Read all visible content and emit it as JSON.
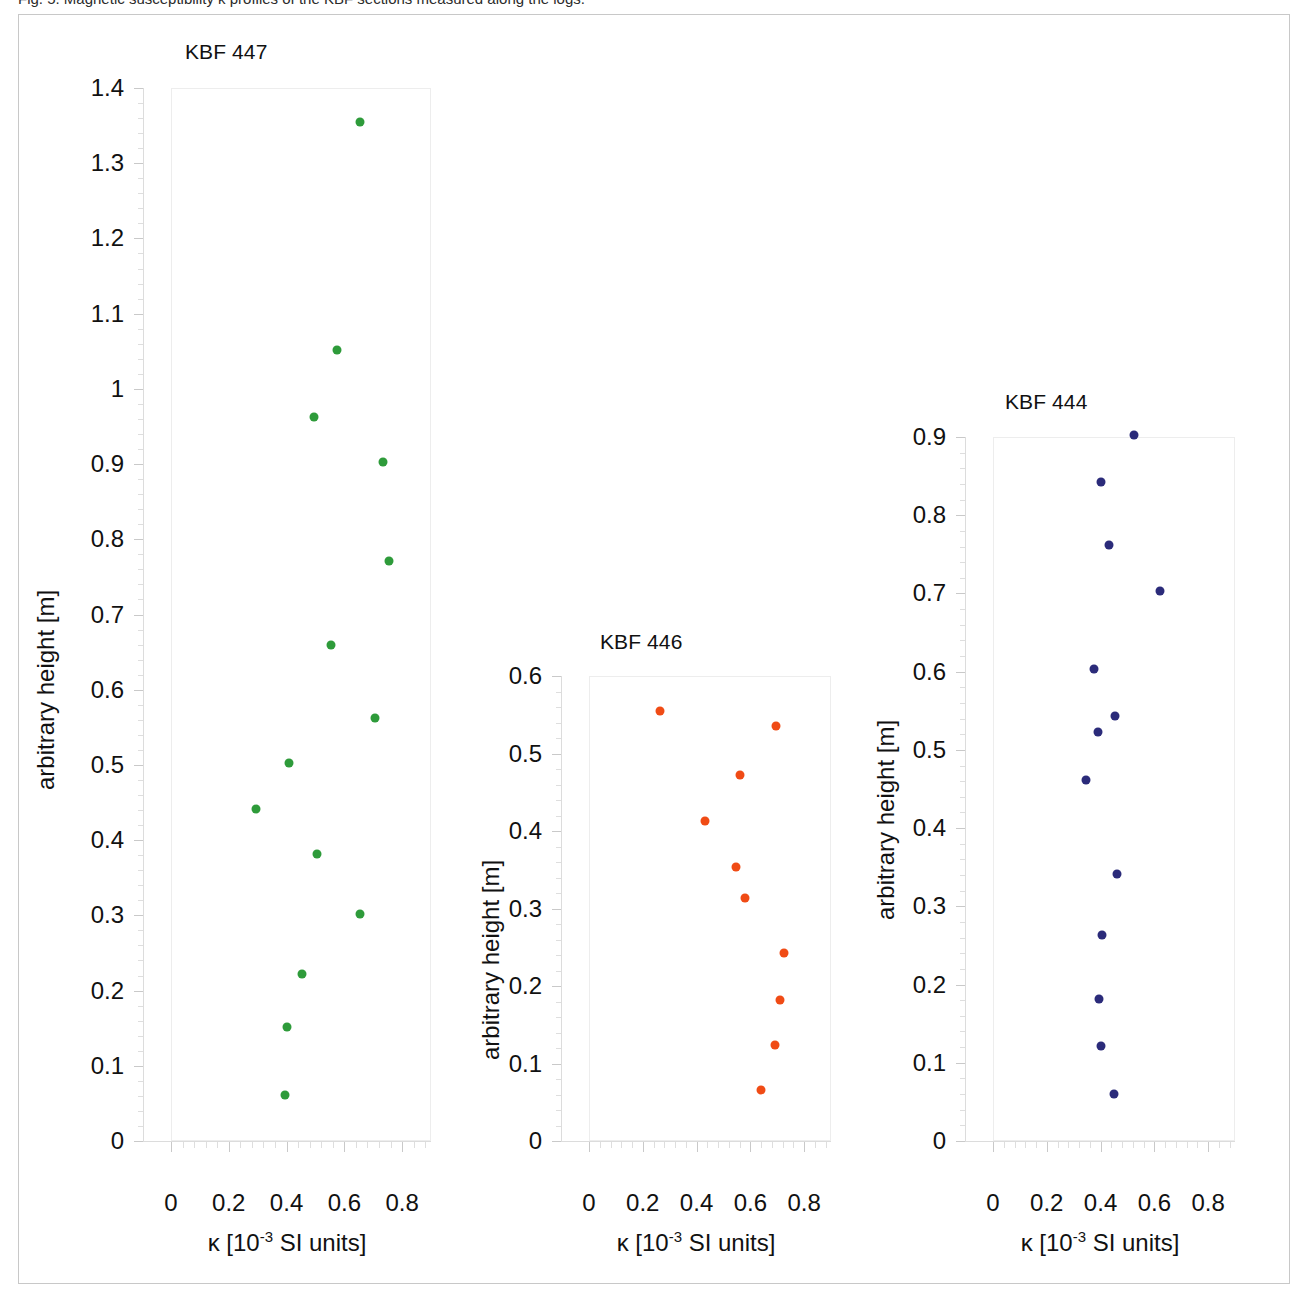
{
  "caption": "Fig. 5.  Magnetic susceptibility κ profiles of the KBF sections measured along the logs.",
  "axis_titles": {
    "y": "arbitrary height [m]",
    "x_prefix": "κ [10",
    "x_exponent": "-3",
    "x_suffix": " SI units]"
  },
  "chart_data": [
    {
      "type": "scatter",
      "title": "KBF 447",
      "xlabel": "κ [10-3 SI units]",
      "ylabel": "arbitrary height [m]",
      "color": "#2e9b3a",
      "xlim": [
        0,
        0.9
      ],
      "ylim": [
        0,
        1.4
      ],
      "xticks": [
        0,
        0.2,
        0.4,
        0.6,
        0.8
      ],
      "xtick_labels": [
        "0",
        "0.2",
        "0.4",
        "0.6",
        "0.8"
      ],
      "yticks": [
        0,
        0.1,
        0.2,
        0.3,
        0.4,
        0.5,
        0.6,
        0.7,
        0.8,
        0.9,
        1,
        1.1,
        1.2,
        1.3,
        1.4
      ],
      "ytick_labels": [
        "0",
        "0.1",
        "0.2",
        "0.3",
        "0.4",
        "0.5",
        "0.6",
        "0.7",
        "0.8",
        "0.9",
        "1",
        "1.1",
        "1.2",
        "1.3",
        "1.4"
      ],
      "points": [
        {
          "x": 0.655,
          "y": 1.355
        },
        {
          "x": 0.575,
          "y": 1.052
        },
        {
          "x": 0.495,
          "y": 0.962
        },
        {
          "x": 0.735,
          "y": 0.903
        },
        {
          "x": 0.755,
          "y": 0.771
        },
        {
          "x": 0.555,
          "y": 0.66
        },
        {
          "x": 0.705,
          "y": 0.562
        },
        {
          "x": 0.41,
          "y": 0.503
        },
        {
          "x": 0.295,
          "y": 0.441
        },
        {
          "x": 0.505,
          "y": 0.381
        },
        {
          "x": 0.655,
          "y": 0.302
        },
        {
          "x": 0.455,
          "y": 0.222
        },
        {
          "x": 0.4,
          "y": 0.152
        },
        {
          "x": 0.395,
          "y": 0.061
        }
      ]
    },
    {
      "type": "scatter",
      "title": "KBF 446",
      "xlabel": "κ [10-3 SI units]",
      "ylabel": "arbitrary height [m]",
      "color": "#f04b15",
      "xlim": [
        0,
        0.9
      ],
      "ylim": [
        0,
        0.6
      ],
      "xticks": [
        0,
        0.2,
        0.4,
        0.6,
        0.8
      ],
      "xtick_labels": [
        "0",
        "0.2",
        "0.4",
        "0.6",
        "0.8"
      ],
      "yticks": [
        0,
        0.1,
        0.2,
        0.3,
        0.4,
        0.5,
        0.6
      ],
      "ytick_labels": [
        "0",
        "0.1",
        "0.2",
        "0.3",
        "0.4",
        "0.5",
        "0.6"
      ],
      "points": [
        {
          "x": 0.265,
          "y": 0.555
        },
        {
          "x": 0.695,
          "y": 0.535
        },
        {
          "x": 0.56,
          "y": 0.472
        },
        {
          "x": 0.43,
          "y": 0.413
        },
        {
          "x": 0.545,
          "y": 0.353
        },
        {
          "x": 0.58,
          "y": 0.313
        },
        {
          "x": 0.725,
          "y": 0.243
        },
        {
          "x": 0.71,
          "y": 0.182
        },
        {
          "x": 0.69,
          "y": 0.124
        },
        {
          "x": 0.64,
          "y": 0.066
        }
      ]
    },
    {
      "type": "scatter",
      "title": "KBF 444",
      "xlabel": "κ [10-3 SI units]",
      "ylabel": "arbitrary height [m]",
      "color": "#2b2b7a",
      "xlim": [
        0,
        0.9
      ],
      "ylim": [
        0,
        0.9
      ],
      "xticks": [
        0,
        0.2,
        0.4,
        0.6,
        0.8
      ],
      "xtick_labels": [
        "0",
        "0.2",
        "0.4",
        "0.6",
        "0.8"
      ],
      "yticks": [
        0,
        0.1,
        0.2,
        0.3,
        0.4,
        0.5,
        0.6,
        0.7,
        0.8,
        0.9
      ],
      "ytick_labels": [
        "0",
        "0.1",
        "0.2",
        "0.3",
        "0.4",
        "0.5",
        "0.6",
        "0.7",
        "0.8",
        "0.9"
      ],
      "points": [
        {
          "x": 0.525,
          "y": 0.903
        },
        {
          "x": 0.4,
          "y": 0.843
        },
        {
          "x": 0.43,
          "y": 0.762
        },
        {
          "x": 0.62,
          "y": 0.703
        },
        {
          "x": 0.375,
          "y": 0.603
        },
        {
          "x": 0.455,
          "y": 0.543
        },
        {
          "x": 0.39,
          "y": 0.523
        },
        {
          "x": 0.345,
          "y": 0.462
        },
        {
          "x": 0.46,
          "y": 0.341
        },
        {
          "x": 0.405,
          "y": 0.263
        },
        {
          "x": 0.395,
          "y": 0.181
        },
        {
          "x": 0.403,
          "y": 0.121
        },
        {
          "x": 0.45,
          "y": 0.06
        }
      ]
    }
  ]
}
